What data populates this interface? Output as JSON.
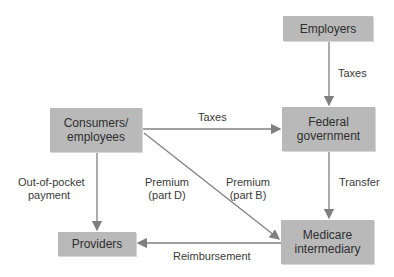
{
  "nodes": {
    "employers": "Employers",
    "consumers": "Consumers/ employees",
    "federal": "Federal government",
    "providers": "Providers",
    "medicare": "Medicare intermediary"
  },
  "edges": {
    "employers_to_federal": "Taxes",
    "consumers_to_federal": "Taxes",
    "consumers_to_providers_1": "Out-of-pocket",
    "consumers_to_providers_2": "payment",
    "premium_d_1": "Premium",
    "premium_d_2": "(part D)",
    "premium_b_1": "Premium",
    "premium_b_2": "(part B)",
    "federal_to_medicare": "Transfer",
    "medicare_to_providers": "Reimbursement"
  },
  "colors": {
    "box": "#b9b9b9",
    "arrow": "#808080"
  }
}
